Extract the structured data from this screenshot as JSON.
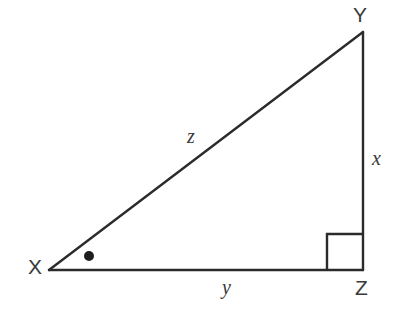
{
  "figure": {
    "kind": "right-triangle-diagram",
    "background_color": "#ffffff",
    "stroke_color": "#2b2b2b",
    "text_color": "#3a3a3a"
  },
  "vertices": {
    "x": {
      "label": "X",
      "px": 49,
      "py": 270
    },
    "y": {
      "label": "Y",
      "px": 363,
      "py": 32
    },
    "z": {
      "label": "Z",
      "px": 363,
      "py": 270
    }
  },
  "sides": {
    "hypotenuse": {
      "label": "z",
      "from": "X",
      "to": "Y"
    },
    "vertical_leg": {
      "label": "x",
      "from": "Y",
      "to": "Z"
    },
    "horizontal_leg": {
      "label": "y",
      "from": "X",
      "to": "Z"
    }
  },
  "markers": {
    "right_angle": {
      "at_vertex": "Z",
      "name": "right-angle-square",
      "size": 36
    },
    "angle_dot": {
      "at_vertex": "X",
      "name": "angle-marker-dot",
      "px": 89,
      "py": 256,
      "radius": 5
    }
  }
}
